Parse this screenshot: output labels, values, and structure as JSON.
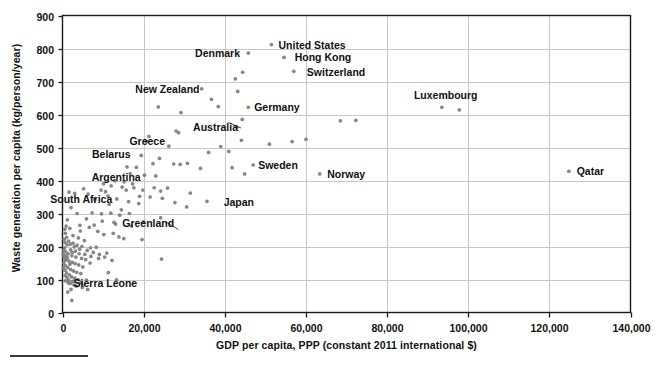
{
  "chart_data": {
    "type": "scatter",
    "title": "",
    "xlabel": "GDP per capita, PPP (constant 2011 international $)",
    "ylabel": "Waste generation per capita (kg/person/year)",
    "xlim": [
      0,
      140000
    ],
    "ylim": [
      0,
      900
    ],
    "xticks": [
      0,
      20000,
      40000,
      60000,
      80000,
      100000,
      120000,
      140000
    ],
    "xticklabels": [
      "0",
      "20,000",
      "40,000",
      "60,000",
      "80,000",
      "100,000",
      "120,000",
      "140,000"
    ],
    "yticks": [
      0,
      100,
      200,
      300,
      400,
      500,
      600,
      700,
      800,
      900
    ],
    "yticklabels": [
      "0",
      "100",
      "200",
      "300",
      "400",
      "500",
      "600",
      "700",
      "800",
      "900"
    ],
    "grid": true,
    "legend": "none",
    "marker_color": "#808080",
    "marker_size": 3,
    "annotations": [
      {
        "label": "United States",
        "x": 52000,
        "y": 812,
        "anchor": "left"
      },
      {
        "label": "Denmark",
        "x": 45000,
        "y": 785,
        "anchor": "right"
      },
      {
        "label": "Hong Kong",
        "x": 56000,
        "y": 773,
        "anchor": "left"
      },
      {
        "label": "Switzerland",
        "x": 59000,
        "y": 730,
        "anchor": "left"
      },
      {
        "label": "Luxembourg",
        "x": 95000,
        "y": 620,
        "anchor": "above"
      },
      {
        "label": "New Zealand",
        "x": 35000,
        "y": 678,
        "anchor": "right"
      },
      {
        "label": "Germany",
        "x": 46000,
        "y": 622,
        "anchor": "left"
      },
      {
        "label": "Australia",
        "x": 44500,
        "y": 562,
        "anchor": "right"
      },
      {
        "label": "Greece",
        "x": 26500,
        "y": 519,
        "anchor": "right"
      },
      {
        "label": "Belarus",
        "x": 18000,
        "y": 481,
        "anchor": "right"
      },
      {
        "label": "Sweden",
        "x": 47000,
        "y": 448,
        "anchor": "left"
      },
      {
        "label": "Argentina",
        "x": 20500,
        "y": 411,
        "anchor": "right"
      },
      {
        "label": "Norway",
        "x": 64000,
        "y": 420,
        "anchor": "left"
      },
      {
        "label": "Qatar",
        "x": 125500,
        "y": 428,
        "anchor": "left"
      },
      {
        "label": "South Africa",
        "x": 13500,
        "y": 345,
        "anchor": "right"
      },
      {
        "label": "Japan",
        "x": 38500,
        "y": 335,
        "anchor": "left"
      },
      {
        "label": "Greenland",
        "x": 13500,
        "y": 272,
        "anchor": "left"
      },
      {
        "label": "Sierra Leone",
        "x": 1500,
        "y": 90,
        "anchor": "left"
      }
    ],
    "points": [
      [
        51500,
        812
      ],
      [
        54600,
        773
      ],
      [
        57000,
        731
      ],
      [
        45800,
        786
      ],
      [
        34300,
        678
      ],
      [
        44400,
        728
      ],
      [
        42600,
        708
      ],
      [
        43200,
        670
      ],
      [
        45800,
        622
      ],
      [
        36700,
        646
      ],
      [
        38400,
        624
      ],
      [
        23600,
        623
      ],
      [
        29200,
        606
      ],
      [
        44300,
        585
      ],
      [
        43000,
        562
      ],
      [
        93500,
        622
      ],
      [
        97800,
        614
      ],
      [
        72300,
        582
      ],
      [
        68500,
        581
      ],
      [
        28000,
        550
      ],
      [
        21300,
        534
      ],
      [
        26200,
        504
      ],
      [
        39000,
        503
      ],
      [
        20700,
        518
      ],
      [
        28600,
        545
      ],
      [
        41000,
        488
      ],
      [
        36000,
        485
      ],
      [
        44100,
        522
      ],
      [
        51000,
        510
      ],
      [
        56600,
        518
      ],
      [
        60000,
        525
      ],
      [
        23900,
        467
      ],
      [
        34000,
        437
      ],
      [
        30800,
        452
      ],
      [
        27400,
        450
      ],
      [
        29000,
        449
      ],
      [
        22300,
        451
      ],
      [
        19400,
        476
      ],
      [
        47000,
        447
      ],
      [
        44900,
        420
      ],
      [
        41800,
        439
      ],
      [
        124800,
        428
      ],
      [
        63400,
        420
      ],
      [
        18200,
        440
      ],
      [
        15900,
        441
      ],
      [
        16700,
        421
      ],
      [
        20200,
        416
      ],
      [
        23000,
        414
      ],
      [
        12900,
        399
      ],
      [
        15200,
        396
      ],
      [
        17300,
        390
      ],
      [
        17600,
        378
      ],
      [
        19800,
        371
      ],
      [
        22600,
        378
      ],
      [
        24200,
        368
      ],
      [
        31500,
        362
      ],
      [
        35600,
        337
      ],
      [
        25900,
        377
      ],
      [
        9500,
        371
      ],
      [
        11200,
        353
      ],
      [
        8000,
        342
      ],
      [
        10600,
        366
      ],
      [
        5200,
        375
      ],
      [
        6300,
        359
      ],
      [
        1600,
        365
      ],
      [
        3000,
        361
      ],
      [
        21600,
        350
      ],
      [
        24600,
        346
      ],
      [
        27700,
        333
      ],
      [
        30600,
        320
      ],
      [
        18800,
        330
      ],
      [
        16300,
        336
      ],
      [
        13400,
        344
      ],
      [
        11500,
        328
      ],
      [
        2100,
        318
      ],
      [
        3600,
        300
      ],
      [
        7300,
        302
      ],
      [
        9600,
        299
      ],
      [
        11900,
        301
      ],
      [
        14100,
        295
      ],
      [
        24200,
        287
      ],
      [
        20000,
        275
      ],
      [
        17000,
        262
      ],
      [
        13100,
        268
      ],
      [
        5900,
        284
      ],
      [
        1200,
        281
      ],
      [
        900,
        262
      ],
      [
        1800,
        255
      ],
      [
        4400,
        247
      ],
      [
        6600,
        258
      ],
      [
        8700,
        246
      ],
      [
        10200,
        236
      ],
      [
        12500,
        240
      ],
      [
        15100,
        224
      ],
      [
        19600,
        221
      ],
      [
        2600,
        233
      ],
      [
        3900,
        226
      ],
      [
        5400,
        218
      ],
      [
        700,
        240
      ],
      [
        600,
        212
      ],
      [
        1100,
        205
      ],
      [
        1900,
        207
      ],
      [
        2900,
        199
      ],
      [
        4200,
        192
      ],
      [
        6100,
        188
      ],
      [
        7600,
        182
      ],
      [
        9100,
        176
      ],
      [
        10900,
        180
      ],
      [
        8300,
        198
      ],
      [
        500,
        196
      ],
      [
        800,
        184
      ],
      [
        1400,
        178
      ],
      [
        2300,
        172
      ],
      [
        3300,
        168
      ],
      [
        4700,
        164
      ],
      [
        5700,
        160
      ],
      [
        12200,
        158
      ],
      [
        24400,
        162
      ],
      [
        400,
        168
      ],
      [
        900,
        160
      ],
      [
        1600,
        156
      ],
      [
        2400,
        152
      ],
      [
        3100,
        148
      ],
      [
        4000,
        144
      ],
      [
        5000,
        138
      ],
      [
        6800,
        150
      ],
      [
        11300,
        121
      ],
      [
        300,
        150
      ],
      [
        700,
        142
      ],
      [
        1300,
        136
      ],
      [
        2000,
        130
      ],
      [
        2700,
        126
      ],
      [
        3500,
        122
      ],
      [
        4500,
        118
      ],
      [
        13300,
        99
      ],
      [
        200,
        134
      ],
      [
        600,
        128
      ],
      [
        1000,
        120
      ],
      [
        1700,
        114
      ],
      [
        2200,
        108
      ],
      [
        3000,
        104
      ],
      [
        3800,
        100
      ],
      [
        600,
        112
      ],
      [
        1100,
        106
      ],
      [
        1500,
        98
      ],
      [
        2500,
        94
      ],
      [
        4600,
        92
      ],
      [
        5900,
        98
      ],
      [
        1900,
        88
      ],
      [
        2800,
        84
      ],
      [
        3400,
        80
      ],
      [
        4900,
        76
      ],
      [
        2100,
        70
      ],
      [
        6200,
        70
      ],
      [
        1300,
        62
      ],
      [
        2300,
        37
      ],
      [
        700,
        96
      ],
      [
        1400,
        90
      ],
      [
        200,
        176
      ],
      [
        350,
        188
      ],
      [
        450,
        222
      ],
      [
        550,
        252
      ],
      [
        1000,
        228
      ],
      [
        1500,
        216
      ],
      [
        2600,
        210
      ],
      [
        3600,
        204
      ],
      [
        4800,
        200
      ],
      [
        7000,
        170
      ],
      [
        8900,
        164
      ],
      [
        10400,
        168
      ],
      [
        2000,
        190
      ],
      [
        2400,
        182
      ],
      [
        3200,
        186
      ],
      [
        4100,
        178
      ],
      [
        900,
        172
      ],
      [
        1200,
        166
      ],
      [
        650,
        158
      ],
      [
        1800,
        146
      ],
      [
        5500,
        176
      ],
      [
        6900,
        196
      ],
      [
        13900,
        229
      ],
      [
        14500,
        311
      ],
      [
        16500,
        300
      ],
      [
        9800,
        277
      ],
      [
        7800,
        265
      ],
      [
        4300,
        264
      ],
      [
        12700,
        273
      ],
      [
        15700,
        371
      ],
      [
        19000,
        352
      ],
      [
        12000,
        384
      ],
      [
        14700,
        380
      ],
      [
        10100,
        390
      ]
    ]
  }
}
